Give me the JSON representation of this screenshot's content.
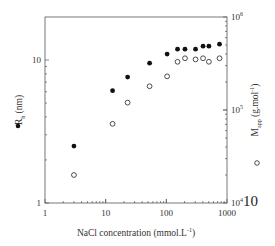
{
  "chart_data": {
    "type": "scatter",
    "title": "",
    "xlabel": "NaCl concentration (mmol.L-1)",
    "xlabel_main": "NaCl concentration (mmol.L",
    "xlabel_sup": "-1",
    "xlabel_end": ")",
    "ylabel_left": "Rh (nm)",
    "ylabel_left_main": "R",
    "ylabel_left_sub": "h",
    "ylabel_left_end": " (nm)",
    "ylabel_right": "Mapp (g.mol-1)",
    "ylabel_right_main": "M",
    "ylabel_right_sub": "app",
    "ylabel_right_end": " (g.mol",
    "ylabel_right_sup": "-1",
    "ylabel_right_close": ")",
    "x_scale": "log",
    "y_left_scale": "log",
    "y_right_scale": "log",
    "xlim": [
      1,
      1000
    ],
    "ylim_left": [
      1,
      20
    ],
    "ylim_right": [
      10000,
      1000000
    ],
    "x_ticks": [
      "1",
      "10",
      "100",
      "1000"
    ],
    "y_left_ticks": [
      "1",
      "10"
    ],
    "y_right_ticks": [
      {
        "base": "10",
        "exp": "4"
      },
      {
        "base": "10",
        "exp": "5"
      },
      {
        "base": "10",
        "exp": "6"
      }
    ],
    "stray_label": "10",
    "grid": false,
    "legend": [
      {
        "marker": "filled-circle",
        "axis": "left",
        "name": "Rh (nm)"
      },
      {
        "marker": "open-circle",
        "axis": "right",
        "name": "Mapp (g.mol-1)"
      }
    ],
    "series": [
      {
        "name": "Rh (nm)",
        "marker": "filled-circle",
        "axis": "left",
        "x": [
          3,
          13,
          23,
          53,
          103,
          153,
          203,
          303,
          403,
          503,
          753
        ],
        "values": [
          2.5,
          6.1,
          7.6,
          9.5,
          11.0,
          11.9,
          11.9,
          11.9,
          12.5,
          12.5,
          12.9
        ]
      },
      {
        "name": "Mapp (g.mol-1)",
        "marker": "open-circle",
        "axis": "right",
        "x": [
          3,
          13,
          23,
          53,
          103,
          153,
          203,
          303,
          403,
          503,
          753
        ],
        "values": [
          20000,
          71000,
          120000,
          180000,
          230000,
          330000,
          360000,
          350000,
          360000,
          330000,
          360000
        ]
      }
    ]
  }
}
